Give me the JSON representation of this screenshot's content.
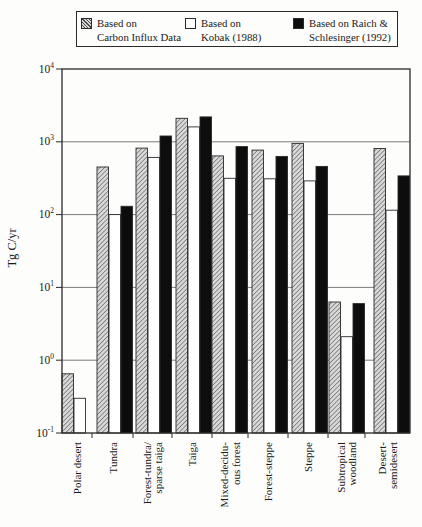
{
  "figure": {
    "legend": [
      {
        "line1": "Based on",
        "line2": "Carbon Influx Data",
        "swatch": "hatched"
      },
      {
        "line1": "Based on",
        "line2": "Kobak (1988)",
        "swatch": "white"
      },
      {
        "line1": "Based on Raich &",
        "line2": "Schlesinger (1992)",
        "swatch": "black"
      }
    ],
    "colors": {
      "hatch_fill": "#d9d9d9",
      "hatch_line": "#4a4a4a",
      "black_bar": "#0d0d0d",
      "white_bar": "#ffffff",
      "ink": "#2a2a2a",
      "grid": "#5a5a5a"
    }
  },
  "chart_data": {
    "type": "bar",
    "title": "",
    "xlabel": "",
    "ylabel": "Tg C/yr",
    "yscale": "log",
    "ylim": [
      0.1,
      10000
    ],
    "ytick_exponents": [
      4,
      3,
      2,
      1,
      0,
      -1
    ],
    "grid": true,
    "legend_position": "top",
    "categories": [
      "Polar desert",
      "Tundra",
      "Forest-tundra/\nsparse taiga",
      "Taiga",
      "Mixed-decidu-\nous forest",
      "Forest-steppe",
      "Steppe",
      "Subtropical\nwoodland",
      "Desert-\nsemidesert"
    ],
    "series": [
      {
        "name": "Based on Carbon Influx Data",
        "style": "hatched",
        "values": [
          0.65,
          450,
          820,
          2100,
          640,
          770,
          950,
          6.3,
          810
        ]
      },
      {
        "name": "Based on Kobak (1988)",
        "style": "white",
        "values": [
          0.3,
          100,
          610,
          1600,
          315,
          310,
          290,
          2.1,
          115
        ]
      },
      {
        "name": "Based on Raich & Schlesinger (1992)",
        "style": "black",
        "values": [
          null,
          130,
          1200,
          2200,
          860,
          630,
          460,
          6.0,
          340
        ]
      }
    ]
  }
}
